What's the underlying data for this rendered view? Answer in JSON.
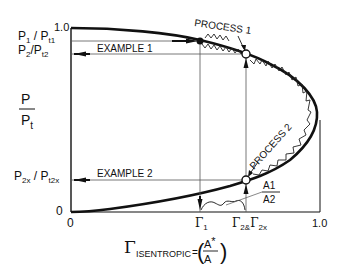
{
  "diagram": {
    "y_axis": {
      "label_numerator": "P",
      "label_denominator": "P",
      "label_denominator_sub": "t",
      "tick_top": "1.0",
      "tick_bottom": "0",
      "p1_label": "P",
      "p1_sub": "1",
      "p1_sep": " / P",
      "p1_sub2": "t1",
      "p2_label": "P",
      "p2_sub": "2",
      "p2_sep": "/P",
      "p2_sub2": "t2",
      "p2x_label": "P",
      "p2x_sub": "2x",
      "p2x_sep": " / P",
      "p2x_sub2": "t2x"
    },
    "x_axis": {
      "tick_left": "0",
      "tick_right": "1.0",
      "gamma1": "Γ",
      "gamma1_sub": "1",
      "gamma2": "Γ",
      "gamma2_sub": "2",
      "gamma_and": "&",
      "gamma2x": "Γ",
      "gamma2x_sub": "2x",
      "title_symbol": "Γ",
      "title_sub": "ISENTROPIC",
      "title_eq": "=",
      "title_frac_num": "A",
      "title_frac_num_sup": "*",
      "title_frac_den": "A"
    },
    "annotations": {
      "example1": "EXAMPLE 1",
      "example2": "EXAMPLE 2",
      "process1": "PROCESS 1",
      "process2": "PROCESS 2",
      "area_ratio_num": "A1",
      "area_ratio_den": "A2"
    },
    "colors": {
      "ink": "#111111",
      "thin_line": "#444444",
      "background": "#ffffff"
    }
  }
}
